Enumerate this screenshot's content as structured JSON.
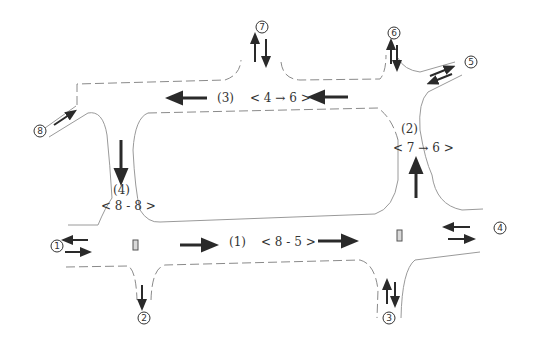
{
  "diagram": {
    "type": "road-network-traffic-flow",
    "links": [
      {
        "id": "1",
        "label": "(1)",
        "od": "< 8 - 5 >",
        "direction": "east"
      },
      {
        "id": "2",
        "label": "(2)",
        "od": "< 7 → 6 >",
        "direction": "north"
      },
      {
        "id": "3",
        "label": "(3)",
        "od": "< 4 → 6 >",
        "direction": "west"
      },
      {
        "id": "4",
        "label": "(4)",
        "od": "< 8 - 8 >",
        "direction": "south"
      }
    ],
    "nodes": [
      {
        "id": "1",
        "symbol": "1",
        "flows": "two-way"
      },
      {
        "id": "2",
        "symbol": "2",
        "flows": "one-way"
      },
      {
        "id": "3",
        "symbol": "3",
        "flows": "two-way"
      },
      {
        "id": "4",
        "symbol": "4",
        "flows": "two-way"
      },
      {
        "id": "5",
        "symbol": "5",
        "flows": "two-way"
      },
      {
        "id": "6",
        "symbol": "6",
        "flows": "two-way"
      },
      {
        "id": "7",
        "symbol": "7",
        "flows": "two-way"
      },
      {
        "id": "8",
        "symbol": "8",
        "flows": "one-way"
      }
    ],
    "signals": [
      "signal-left-intersection",
      "signal-right-intersection"
    ],
    "colors": {
      "arrow": "#2a2a2a",
      "road_edge": "#8a8a8a",
      "text": "#333333"
    }
  }
}
